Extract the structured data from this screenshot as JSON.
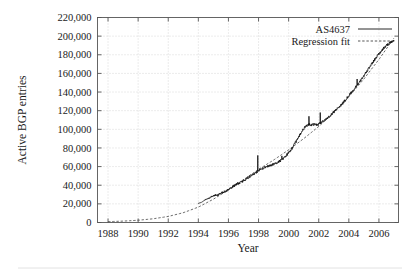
{
  "chart_data": {
    "type": "line",
    "title": "",
    "xlabel": "Year",
    "ylabel": "Active BGP entries",
    "xlim": [
      1987.3,
      2007.3
    ],
    "ylim": [
      0,
      220000
    ],
    "grid": true,
    "legend_position": "top-right",
    "xticks": [
      1988,
      1990,
      1992,
      1994,
      1996,
      1998,
      2000,
      2002,
      2004,
      2006
    ],
    "xtick_labels": [
      "1988",
      "1990",
      "1992",
      "1994",
      "1996",
      "1998",
      "2000",
      "2002",
      "2004",
      "2006"
    ],
    "yticks": [
      0,
      20000,
      40000,
      60000,
      80000,
      100000,
      120000,
      140000,
      160000,
      180000,
      200000,
      220000
    ],
    "ytick_labels": [
      "0",
      "20,000",
      "40,000",
      "60,000",
      "80,000",
      "100,000",
      "120,000",
      "140,000",
      "160,000",
      "180,000",
      "200,000",
      "220,000"
    ],
    "series": [
      {
        "name": "AS4637",
        "style": "solid",
        "color": "#111111",
        "x": [
          1994.0,
          1994.12,
          1994.25,
          1994.37,
          1994.5,
          1994.62,
          1994.75,
          1994.87,
          1995.0,
          1995.12,
          1995.25,
          1995.37,
          1995.5,
          1995.62,
          1995.75,
          1995.87,
          1996.0,
          1996.12,
          1996.25,
          1996.37,
          1996.5,
          1996.62,
          1996.75,
          1996.87,
          1997.0,
          1997.12,
          1997.25,
          1997.37,
          1997.5,
          1997.62,
          1997.75,
          1997.87,
          1998.0,
          1998.12,
          1998.25,
          1998.37,
          1998.5,
          1998.62,
          1998.75,
          1998.87,
          1999.0,
          1999.12,
          1999.25,
          1999.37,
          1999.5,
          1999.62,
          1999.75,
          1999.87,
          2000.0,
          2000.12,
          2000.25,
          2000.37,
          2000.5,
          2000.62,
          2000.75,
          2000.87,
          2001.0,
          2001.12,
          2001.25,
          2001.37,
          2001.5,
          2001.62,
          2001.75,
          2001.87,
          2002.0,
          2002.12,
          2002.25,
          2002.37,
          2002.5,
          2002.62,
          2002.75,
          2002.87,
          2003.0,
          2003.12,
          2003.25,
          2003.37,
          2003.5,
          2003.62,
          2003.75,
          2003.87,
          2004.0,
          2004.12,
          2004.25,
          2004.37,
          2004.5,
          2004.62,
          2004.75,
          2004.87,
          2005.0,
          2005.12,
          2005.25,
          2005.37,
          2005.5,
          2005.62,
          2005.75,
          2005.87,
          2006.0,
          2006.12,
          2006.25,
          2006.37,
          2006.5,
          2006.62,
          2006.75,
          2006.87,
          2007.0
        ],
        "y": [
          20500,
          21200,
          22000,
          23500,
          24800,
          25600,
          26400,
          27800,
          28500,
          29400,
          29000,
          30200,
          31500,
          32400,
          33000,
          34200,
          35500,
          36800,
          38000,
          39200,
          40500,
          41800,
          42600,
          43800,
          45000,
          46200,
          47500,
          48800,
          50200,
          51500,
          52800,
          54000,
          55500,
          56800,
          57500,
          58800,
          59500,
          60200,
          61000,
          61800,
          62500,
          63200,
          64000,
          65500,
          67000,
          68500,
          70500,
          72500,
          74500,
          77000,
          80000,
          83500,
          87000,
          90500,
          94000,
          97500,
          100500,
          103000,
          104500,
          105000,
          104800,
          105200,
          105500,
          104900,
          105500,
          106500,
          108000,
          109500,
          111000,
          112500,
          114500,
          116500,
          118500,
          120500,
          122500,
          124500,
          126500,
          128500,
          131000,
          133500,
          136000,
          138500,
          141000,
          143500,
          146000,
          148500,
          151500,
          154500,
          157500,
          160500,
          163500,
          166500,
          169500,
          172500,
          175500,
          178500,
          181000,
          183500,
          186000,
          188000,
          190000,
          191500,
          193000,
          194000,
          195000
        ],
        "noise_amplitude": 1400,
        "spikes": [
          {
            "x": 1997.95,
            "y": 72000
          },
          {
            "x": 1999.55,
            "y": 71500
          },
          {
            "x": 2001.35,
            "y": 114000
          },
          {
            "x": 2002.1,
            "y": 118000
          },
          {
            "x": 2004.55,
            "y": 154000
          }
        ]
      },
      {
        "name": "Regression fit",
        "style": "dashed",
        "color": "#444444",
        "x": [
          1988.0,
          1989.0,
          1990.0,
          1991.0,
          1992.0,
          1993.0,
          1994.0,
          1995.0,
          1996.0,
          1997.0,
          1998.0,
          1999.0,
          2000.0,
          2001.0,
          2002.0,
          2003.0,
          2004.0,
          2005.0,
          2006.0,
          2007.0
        ],
        "y": [
          900,
          1500,
          2400,
          4000,
          6500,
          10500,
          16500,
          25000,
          35000,
          46000,
          57000,
          67000,
          78000,
          90000,
          103000,
          118000,
          135000,
          154000,
          175000,
          198000
        ]
      }
    ]
  }
}
